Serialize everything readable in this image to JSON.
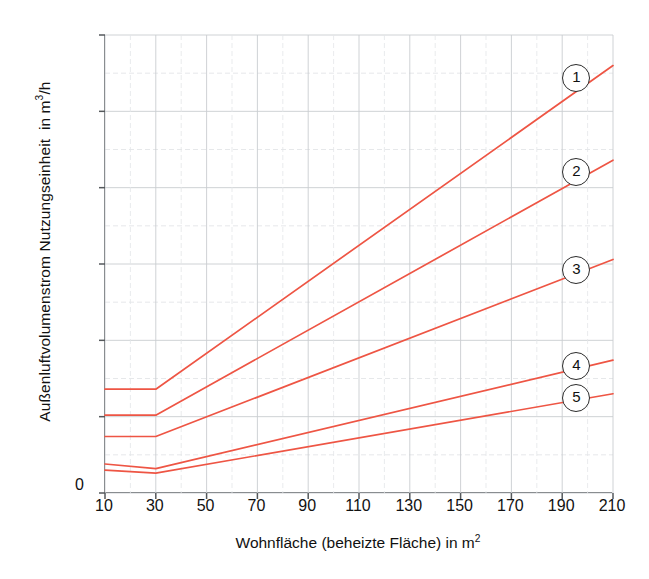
{
  "chart_data": {
    "type": "line",
    "title": "",
    "xlabel": "Wohnfläche (beheizte Fläche) in m²",
    "ylabel": "Außenluftvolumenstrom Nutzungseinheit  in m³/h",
    "xlim": [
      10,
      210
    ],
    "ylim": [
      0,
      300
    ],
    "xticks": [
      10,
      30,
      50,
      70,
      90,
      110,
      130,
      150,
      170,
      190,
      210
    ],
    "yticks": [
      0,
      50,
      100,
      150,
      200,
      250,
      300
    ],
    "y_minor_step": 25,
    "x_minor_step": 10,
    "grid": true,
    "legend_position": "inline-right-circled-labels",
    "origin_label": "0",
    "line_color": "#ee5544",
    "series": [
      {
        "name": "1",
        "label": "1",
        "x": [
          10,
          30,
          210
        ],
        "values": [
          68,
          68,
          280
        ]
      },
      {
        "name": "2",
        "label": "2",
        "x": [
          10,
          30,
          210
        ],
        "values": [
          51,
          51,
          218
        ]
      },
      {
        "name": "3",
        "label": "3",
        "x": [
          10,
          30,
          210
        ],
        "values": [
          37,
          37,
          153
        ]
      },
      {
        "name": "4",
        "label": "4",
        "x": [
          10,
          30,
          210
        ],
        "values": [
          19,
          16,
          87
        ]
      },
      {
        "name": "5",
        "label": "5",
        "x": [
          10,
          30,
          210
        ],
        "values": [
          15,
          13,
          65
        ]
      }
    ],
    "markers": [
      {
        "label": "1",
        "x": 196,
        "y": 272
      },
      {
        "label": "2",
        "x": 196,
        "y": 210
      },
      {
        "label": "3",
        "x": 196,
        "y": 146
      },
      {
        "label": "4",
        "x": 196,
        "y": 83
      },
      {
        "label": "5",
        "x": 196,
        "y": 62
      }
    ]
  }
}
